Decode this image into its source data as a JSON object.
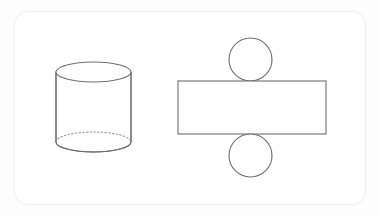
{
  "page": {
    "background_color": "#ffffff"
  },
  "card": {
    "background_color": "#ffffff",
    "border_color": "#f1f1f1",
    "corner_radius": 14,
    "x": 14,
    "y": 11,
    "width": 352,
    "height": 194
  },
  "style": {
    "line_color": "#6f6f6f",
    "hidden_line_color": "#9a9a9a",
    "fill_color": "#ffffff",
    "line_width": 1.1,
    "hidden_line_dash": "dotted"
  },
  "diagram": {
    "type": "geometry-solid-and-net",
    "solid_name": "cylinder",
    "net_name": "cylinder-net",
    "shapes": [
      {
        "name": "cylinder",
        "kind": "solid",
        "parts": [
          {
            "name": "top-ellipse",
            "kind": "ellipse",
            "cx": 93.5,
            "cy": 72,
            "rx": 37.5,
            "ry": 10,
            "style": "solid"
          },
          {
            "name": "left-side-line",
            "kind": "line",
            "x1": 56,
            "y1": 72,
            "x2": 56,
            "y2": 142,
            "style": "solid"
          },
          {
            "name": "right-side-line",
            "kind": "line",
            "x1": 131,
            "y1": 72,
            "x2": 131,
            "y2": 142,
            "style": "solid"
          },
          {
            "name": "bottom-front-arc",
            "kind": "arc",
            "cx": 93.5,
            "cy": 142,
            "rx": 37.5,
            "ry": 10,
            "style": "solid"
          },
          {
            "name": "bottom-back-arc",
            "kind": "arc",
            "cx": 93.5,
            "cy": 142,
            "rx": 37.5,
            "ry": 10,
            "style": "dotted"
          }
        ]
      },
      {
        "name": "cylinder-net",
        "kind": "net",
        "parts": [
          {
            "name": "net-top-circle",
            "kind": "circle",
            "cx": 250.5,
            "cy": 59.5,
            "r": 21.5,
            "style": "solid"
          },
          {
            "name": "net-rectangle",
            "kind": "rect",
            "x": 178,
            "y": 81,
            "width": 148,
            "height": 53,
            "style": "solid"
          },
          {
            "name": "net-bottom-circle",
            "kind": "circle",
            "cx": 250.5,
            "cy": 155.5,
            "r": 21.5,
            "style": "solid"
          }
        ]
      }
    ]
  }
}
